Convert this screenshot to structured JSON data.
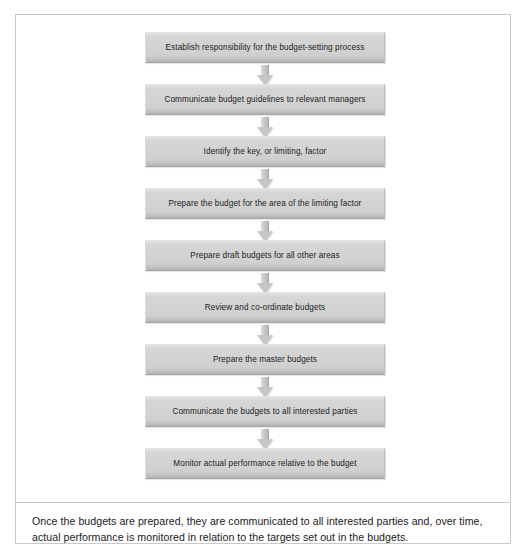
{
  "figure": {
    "type": "flowchart",
    "orientation": "vertical-top-down",
    "connector": "block-arrow-down",
    "box_fill_color": "#d2d2d2",
    "box_border_color": "#a8a8a8",
    "frame_border_color": "#c9c9c9",
    "text_color": "#1c1c1c",
    "steps": [
      {
        "index": 1,
        "label": "Establish responsibility for the budget-setting process"
      },
      {
        "index": 2,
        "label": "Communicate budget guidelines to relevant managers"
      },
      {
        "index": 3,
        "label": "Identify the key, or limiting, factor"
      },
      {
        "index": 4,
        "label": "Prepare the budget for the area of the limiting factor"
      },
      {
        "index": 5,
        "label": "Prepare draft budgets for all other areas"
      },
      {
        "index": 6,
        "label": "Review and co-ordinate budgets"
      },
      {
        "index": 7,
        "label": "Prepare the master budgets"
      },
      {
        "index": 8,
        "label": "Communicate the budgets to all interested parties"
      },
      {
        "index": 9,
        "label": "Monitor actual performance relative to the budget"
      }
    ],
    "arrows": [
      {
        "from": 1,
        "to": 2
      },
      {
        "from": 2,
        "to": 3
      },
      {
        "from": 3,
        "to": 4
      },
      {
        "from": 4,
        "to": 5
      },
      {
        "from": 5,
        "to": 6
      },
      {
        "from": 6,
        "to": 7
      },
      {
        "from": 7,
        "to": 8
      },
      {
        "from": 8,
        "to": 9
      }
    ]
  },
  "caption": {
    "line1": "Once the budgets are prepared, they are communicated to all interested parties and, over time,",
    "line2": "actual performance is monitored in relation to the targets set out in the budgets."
  }
}
